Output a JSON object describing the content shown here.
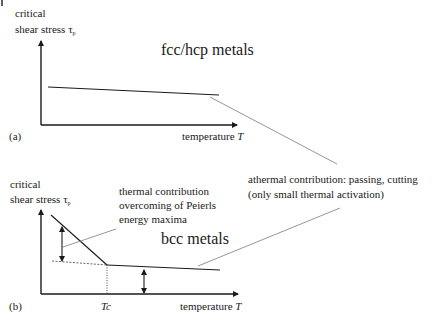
{
  "diagram": {
    "corner_mark": "|",
    "panel_a": {
      "label": "(a)",
      "y_axis_label_line1": "critical",
      "y_axis_label_line2": "shear stress τ",
      "y_axis_subscript": "p",
      "x_axis_label": "temperature ",
      "x_axis_var": "T",
      "title": "fcc/hcp metals"
    },
    "panel_b": {
      "label": "(b)",
      "y_axis_label_line1": "critical",
      "y_axis_label_line2": "shear stress τ",
      "y_axis_subscript": "p",
      "x_axis_label": "temperature ",
      "x_axis_var": "T",
      "title": "bcc metals",
      "tc_label": "Tc",
      "thermal_note_line1": "thermal contribution",
      "thermal_note_line2": "overcoming of Peierls",
      "thermal_note_line3": "energy maxima"
    },
    "athermal_note_line1": "athermal contribution: passing, cutting",
    "athermal_note_line2": "(only small thermal activation)",
    "colors": {
      "ink": "#1a1a1a",
      "pointer": "#8a8a8a"
    }
  }
}
